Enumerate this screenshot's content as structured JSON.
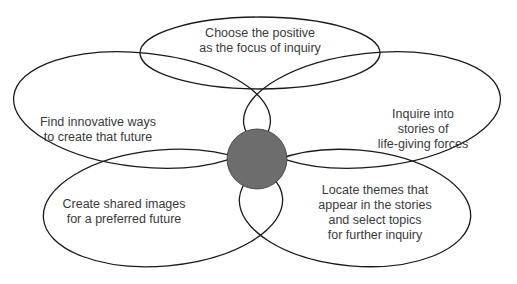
{
  "diagram": {
    "type": "flower / 4-D cycle",
    "colors": {
      "stroke": "#1a1a1a",
      "hub_fill": "#6d6d6d",
      "text": "#3a3a3a",
      "background": "#ffffff"
    },
    "hub": {
      "label": ""
    },
    "petals": [
      {
        "id": "top",
        "text": "Choose the positive\nas the focus of inquiry"
      },
      {
        "id": "left-upper",
        "text": "Find innovative ways\nto create that future"
      },
      {
        "id": "right-upper",
        "text": "Inquire into stories of\nlife-giving forces"
      },
      {
        "id": "left-lower",
        "text": "Create shared images\nfor a preferred future"
      },
      {
        "id": "right-lower",
        "text": "Locate themes that\nappear in the stories\nand select topics\nfor further inquiry"
      }
    ]
  }
}
